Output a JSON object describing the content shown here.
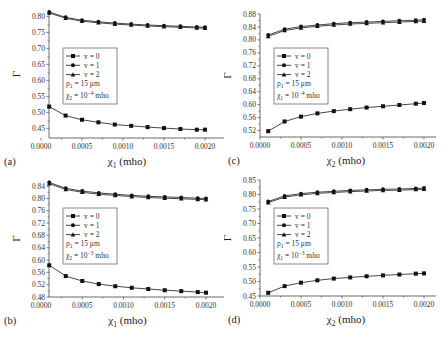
{
  "chart_data": [
    {
      "id": "a",
      "type": "line",
      "panel_label": "(a)",
      "xlabel": "χ1 (mho)",
      "xlabel_main": "χ",
      "xlabel_sub": "1",
      "xlabel_unit": " (mho)",
      "ylabel": "Γ",
      "xlim": [
        0,
        0.0022
      ],
      "ylim": [
        0.42,
        0.82
      ],
      "xticks": [
        0.0,
        0.0005,
        0.001,
        0.0015,
        0.002
      ],
      "xtick_labels": [
        "0.0000",
        "0.0005",
        "0.0010",
        "0.0015",
        "0.0020"
      ],
      "yticks": [
        0.45,
        0.5,
        0.55,
        0.6,
        0.65,
        0.7,
        0.75,
        0.8
      ],
      "ytick_labels": [
        "0.45",
        "0.50",
        "0.55",
        "0.60",
        "0.65",
        "0.70",
        "0.75",
        "0.80"
      ],
      "x": [
        0.0001,
        0.0003,
        0.0005,
        0.0007,
        0.0009,
        0.0011,
        0.0013,
        0.0015,
        0.0017,
        0.0019,
        0.002
      ],
      "series": [
        {
          "name": "v = 0",
          "marker": "square",
          "values": [
            0.518,
            0.49,
            0.477,
            0.469,
            0.462,
            0.458,
            0.454,
            0.451,
            0.448,
            0.446,
            0.446
          ]
        },
        {
          "name": "v = 1",
          "marker": "circle",
          "values": [
            0.814,
            0.797,
            0.788,
            0.783,
            0.779,
            0.776,
            0.773,
            0.771,
            0.769,
            0.767,
            0.766
          ]
        },
        {
          "name": "v = 2",
          "marker": "triangle",
          "values": [
            0.811,
            0.794,
            0.785,
            0.78,
            0.776,
            0.773,
            0.77,
            0.768,
            0.766,
            0.764,
            0.763
          ]
        }
      ],
      "legend": {
        "entries": [
          "v = 0",
          "v = 1",
          "v = 2"
        ],
        "param1": "ρ1 = 15 μm",
        "param1_sym": "ρ",
        "param1_sub": "1",
        "param1_rest": " = 15 μm",
        "param2": "χ2 = 10^-4 mho",
        "param2_sym": "χ",
        "param2_sub": "2",
        "param2_eq": " = 10",
        "param2_exp": "−4",
        "param2_unit": " mho",
        "position": "center-left"
      }
    },
    {
      "id": "b",
      "type": "line",
      "panel_label": "(b)",
      "xlabel": "χ1 (mho)",
      "xlabel_main": "χ",
      "xlabel_sub": "1",
      "xlabel_unit": " (mho)",
      "ylabel": "Γ",
      "xlim": [
        0,
        0.0022
      ],
      "ylim": [
        0.48,
        0.86
      ],
      "xticks": [
        0.0,
        0.0005,
        0.001,
        0.0015,
        0.002
      ],
      "xtick_labels": [
        "0.0000",
        "0.0005",
        "0.0010",
        "0.0015",
        "0.0020"
      ],
      "yticks": [
        0.48,
        0.52,
        0.56,
        0.6,
        0.64,
        0.68,
        0.72,
        0.76,
        0.8,
        0.84
      ],
      "ytick_labels": [
        "0.48",
        "0.52",
        "0.56",
        "0.60",
        "0.64",
        "0.68",
        "0.72",
        "0.76",
        "0.80",
        "0.84"
      ],
      "x": [
        0.0001,
        0.0003,
        0.0005,
        0.0007,
        0.0009,
        0.0011,
        0.0013,
        0.0015,
        0.0017,
        0.0019,
        0.002
      ],
      "series": [
        {
          "name": "v = 0",
          "marker": "square",
          "values": [
            0.583,
            0.548,
            0.532,
            0.522,
            0.515,
            0.51,
            0.506,
            0.502,
            0.499,
            0.496,
            0.494
          ]
        },
        {
          "name": "v = 1",
          "marker": "circle",
          "values": [
            0.852,
            0.833,
            0.824,
            0.818,
            0.814,
            0.81,
            0.807,
            0.805,
            0.803,
            0.801,
            0.8
          ]
        },
        {
          "name": "v = 2",
          "marker": "triangle",
          "values": [
            0.848,
            0.829,
            0.82,
            0.814,
            0.81,
            0.806,
            0.803,
            0.801,
            0.799,
            0.797,
            0.796
          ]
        }
      ],
      "legend": {
        "entries": [
          "v = 0",
          "v = 1",
          "v = 2"
        ],
        "param1": "ρ1 = 15 μm",
        "param1_sym": "ρ",
        "param1_sub": "1",
        "param1_rest": " = 15 μm",
        "param2": "χ2 = 10^-3 mho",
        "param2_sym": "χ",
        "param2_sub": "2",
        "param2_eq": " = 10",
        "param2_exp": "−3",
        "param2_unit": " mho",
        "position": "center-left"
      }
    },
    {
      "id": "c",
      "type": "line",
      "panel_label": "(c)",
      "xlabel": "χ2 (mho)",
      "xlabel_main": "χ",
      "xlabel_sub": "2",
      "xlabel_unit": " (mho)",
      "ylabel": "Γ",
      "xlim": [
        0,
        0.0022
      ],
      "ylim": [
        0.5,
        0.88
      ],
      "xticks": [
        0.0,
        0.0005,
        0.001,
        0.0015,
        0.002
      ],
      "xtick_labels": [
        "0.0000",
        "0.0005",
        "0.0010",
        "0.0015",
        "0.0020"
      ],
      "yticks": [
        0.52,
        0.56,
        0.6,
        0.64,
        0.68,
        0.72,
        0.76,
        0.8,
        0.84,
        0.88
      ],
      "ytick_labels": [
        "0.52",
        "0.56",
        "0.60",
        "0.64",
        "0.68",
        "0.72",
        "0.76",
        "0.80",
        "0.84",
        "0.88"
      ],
      "x": [
        0.0001,
        0.0003,
        0.0005,
        0.0007,
        0.0009,
        0.0011,
        0.0013,
        0.0015,
        0.0017,
        0.0019,
        0.002
      ],
      "series": [
        {
          "name": "v = 0",
          "marker": "square",
          "values": [
            0.518,
            0.548,
            0.563,
            0.573,
            0.58,
            0.586,
            0.591,
            0.595,
            0.599,
            0.603,
            0.605
          ]
        },
        {
          "name": "v = 1",
          "marker": "circle",
          "values": [
            0.815,
            0.833,
            0.841,
            0.846,
            0.85,
            0.853,
            0.855,
            0.857,
            0.859,
            0.861,
            0.862
          ]
        },
        {
          "name": "v = 2",
          "marker": "triangle",
          "values": [
            0.811,
            0.829,
            0.837,
            0.842,
            0.846,
            0.849,
            0.851,
            0.853,
            0.855,
            0.857,
            0.858
          ]
        }
      ],
      "legend": {
        "entries": [
          "v = 0",
          "v = 1",
          "v = 2"
        ],
        "param1": "ρ1 = 15 μm",
        "param1_sym": "ρ",
        "param1_sub": "1",
        "param1_rest": " = 15 μm",
        "param2": "χ1 = 10^-4 mho",
        "param2_sym": "χ",
        "param2_sub": "1",
        "param2_eq": " = 10",
        "param2_exp": "−4",
        "param2_unit": " mho",
        "position": "center-left"
      }
    },
    {
      "id": "d",
      "type": "line",
      "panel_label": "(d)",
      "xlabel": "χ2 (mho)",
      "xlabel_main": "χ",
      "xlabel_sub": "2",
      "xlabel_unit": " (mho)",
      "ylabel": "Γ",
      "xlim": [
        0,
        0.0022
      ],
      "ylim": [
        0.45,
        0.85
      ],
      "xticks": [
        0.0,
        0.0005,
        0.001,
        0.0015,
        0.002
      ],
      "xtick_labels": [
        "0.0000",
        "0.0005",
        "0.0010",
        "0.0015",
        "0.0020"
      ],
      "yticks": [
        0.45,
        0.5,
        0.55,
        0.6,
        0.65,
        0.7,
        0.75,
        0.8,
        0.85
      ],
      "ytick_labels": [
        "0.45",
        "0.50",
        "0.55",
        "0.60",
        "0.65",
        "0.70",
        "0.75",
        "0.80",
        "0.85"
      ],
      "x": [
        0.0001,
        0.0003,
        0.0005,
        0.0007,
        0.0009,
        0.0011,
        0.0013,
        0.0015,
        0.0017,
        0.0019,
        0.002
      ],
      "series": [
        {
          "name": "v = 0",
          "marker": "square",
          "values": [
            0.461,
            0.484,
            0.496,
            0.504,
            0.51,
            0.514,
            0.518,
            0.521,
            0.524,
            0.527,
            0.528
          ]
        },
        {
          "name": "v = 1",
          "marker": "circle",
          "values": [
            0.776,
            0.795,
            0.803,
            0.808,
            0.811,
            0.814,
            0.816,
            0.818,
            0.819,
            0.821,
            0.822
          ]
        },
        {
          "name": "v = 2",
          "marker": "triangle",
          "values": [
            0.772,
            0.791,
            0.799,
            0.804,
            0.807,
            0.81,
            0.812,
            0.814,
            0.815,
            0.817,
            0.818
          ]
        }
      ],
      "legend": {
        "entries": [
          "v = 0",
          "v = 1",
          "v = 2"
        ],
        "param1": "ρ1 = 15 μm",
        "param1_sym": "ρ",
        "param1_sub": "1",
        "param1_rest": " = 15 μm",
        "param2": "χ1 = 10^-3 mho",
        "param2_sym": "χ",
        "param2_sub": "1",
        "param2_eq": " = 10",
        "param2_exp": "−3",
        "param2_unit": " mho",
        "position": "center-left"
      }
    }
  ],
  "layout": {
    "panels": [
      {
        "id": "a",
        "left": 0,
        "top": 0,
        "plot": {
          "x0": 49,
          "x1": 224,
          "y0": 10,
          "y1": 138,
          "xpx0": 41,
          "xpx1": 205
        }
      },
      {
        "id": "c",
        "left": 224,
        "top": 0,
        "plot": {
          "x0": 36,
          "x1": 212,
          "y0": 14,
          "y1": 137,
          "xpx0": 36,
          "xpx1": 200
        }
      },
      {
        "id": "b",
        "left": 0,
        "top": 172,
        "plot": {
          "x0": 49,
          "x1": 224,
          "y0": 8,
          "y1": 125,
          "xpx0": 41,
          "xpx1": 206
        }
      },
      {
        "id": "d",
        "left": 224,
        "top": 172,
        "plot": {
          "x0": 36,
          "x1": 212,
          "y0": 8,
          "y1": 124,
          "xpx0": 36,
          "xpx1": 200
        }
      }
    ],
    "colors": {
      "line": "#333333",
      "marker": "#111111",
      "axis": "#444444",
      "legend_border": "#555555"
    }
  }
}
